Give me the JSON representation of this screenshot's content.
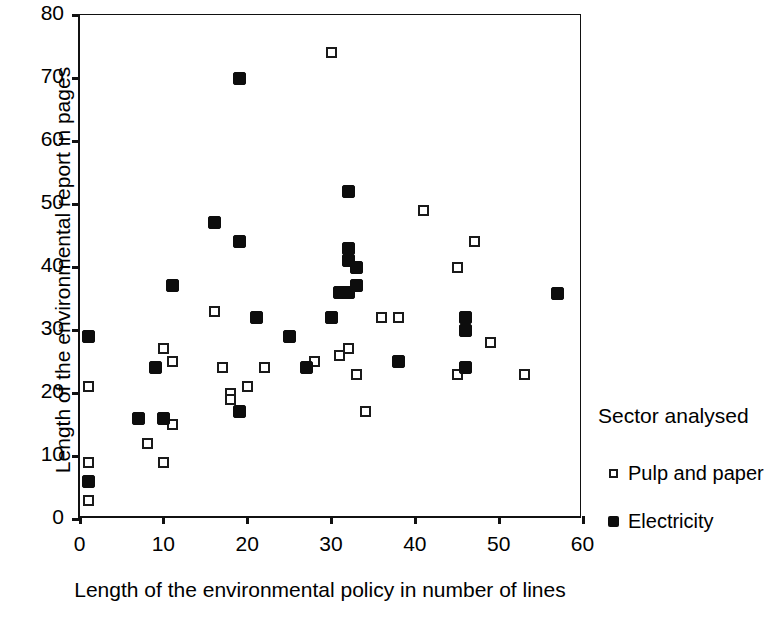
{
  "chart_data": {
    "type": "scatter",
    "title": "",
    "xlabel": "Length of the environmental policy in number of lines",
    "ylabel": "Length of the environmental report in pages",
    "xlim": [
      0,
      60
    ],
    "ylim": [
      0,
      80
    ],
    "xticks": [
      0,
      10,
      20,
      30,
      40,
      50,
      60
    ],
    "yticks": [
      0,
      10,
      20,
      30,
      40,
      50,
      60,
      70,
      80
    ],
    "grid": false,
    "legend_position": "right",
    "legend_title": "Sector analysed",
    "series": [
      {
        "name": "Pulp and paper",
        "marker": "open-square",
        "color": "#1a1a1a",
        "points": [
          [
            1,
            21
          ],
          [
            1,
            9
          ],
          [
            1,
            3
          ],
          [
            8,
            12
          ],
          [
            10,
            9
          ],
          [
            10,
            27
          ],
          [
            11,
            25
          ],
          [
            11,
            15
          ],
          [
            16,
            33
          ],
          [
            17,
            24
          ],
          [
            18,
            20
          ],
          [
            18,
            19
          ],
          [
            20,
            21
          ],
          [
            22,
            24
          ],
          [
            28,
            25
          ],
          [
            30,
            74
          ],
          [
            31,
            26
          ],
          [
            32,
            27
          ],
          [
            33,
            23
          ],
          [
            34,
            17
          ],
          [
            36,
            32
          ],
          [
            38,
            32
          ],
          [
            41,
            49
          ],
          [
            45,
            40
          ],
          [
            45,
            23
          ],
          [
            47,
            44
          ],
          [
            49,
            28
          ],
          [
            53,
            23
          ]
        ]
      },
      {
        "name": "Electricity",
        "marker": "filled-square",
        "color": "#0d0d0d",
        "points": [
          [
            1,
            29
          ],
          [
            1,
            6
          ],
          [
            7,
            16
          ],
          [
            9,
            24
          ],
          [
            10,
            16
          ],
          [
            11,
            37
          ],
          [
            16,
            47
          ],
          [
            19,
            70
          ],
          [
            19,
            44
          ],
          [
            19,
            17
          ],
          [
            21,
            32
          ],
          [
            25,
            29
          ],
          [
            27,
            24
          ],
          [
            30,
            32
          ],
          [
            32,
            52
          ],
          [
            32,
            43
          ],
          [
            32,
            41
          ],
          [
            31,
            36
          ],
          [
            32,
            36
          ],
          [
            33,
            40
          ],
          [
            33,
            37
          ],
          [
            38,
            25
          ],
          [
            46,
            32
          ],
          [
            46,
            30
          ],
          [
            46,
            24
          ],
          [
            57,
            35.8
          ]
        ]
      }
    ]
  },
  "legend": {
    "title": "Sector analysed",
    "entries": [
      {
        "label": "Pulp and paper",
        "marker": "open-square-icon"
      },
      {
        "label": "Electricity",
        "marker": "filled-square-icon"
      }
    ]
  }
}
